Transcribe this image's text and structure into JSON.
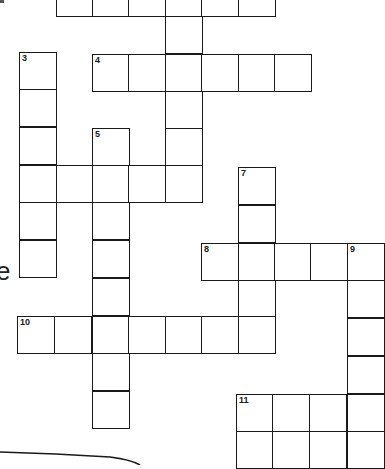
{
  "puzzle": {
    "type": "crossword",
    "cell_size_px": 36.5,
    "clue_numbers": [
      "3",
      "4",
      "5",
      "6",
      "7",
      "8",
      "9",
      "10",
      "11"
    ],
    "edge_text": "e",
    "cells": [
      {
        "x": 56,
        "y": -21,
        "num": ""
      },
      {
        "x": 92,
        "y": -21,
        "num": ""
      },
      {
        "x": 128,
        "y": -21,
        "num": ""
      },
      {
        "x": 165,
        "y": -21,
        "num": ""
      },
      {
        "x": 201,
        "y": -21,
        "num": ""
      },
      {
        "x": 238,
        "y": -21,
        "num": ""
      },
      {
        "x": 165,
        "y": 16,
        "num": ""
      },
      {
        "x": 19,
        "y": 52,
        "num": "3"
      },
      {
        "x": 19,
        "y": 89,
        "num": ""
      },
      {
        "x": 19,
        "y": 127,
        "num": ""
      },
      {
        "x": 19,
        "y": 165,
        "num": ""
      },
      {
        "x": 19,
        "y": 202,
        "num": ""
      },
      {
        "x": 19,
        "y": 240,
        "num": ""
      },
      {
        "x": 92,
        "y": 54,
        "num": "4"
      },
      {
        "x": 128,
        "y": 54,
        "num": ""
      },
      {
        "x": 165,
        "y": 54,
        "num": ""
      },
      {
        "x": 201,
        "y": 54,
        "num": ""
      },
      {
        "x": 238,
        "y": 54,
        "num": ""
      },
      {
        "x": 274,
        "y": 54,
        "num": ""
      },
      {
        "x": 165,
        "y": 91,
        "num": ""
      },
      {
        "x": 165,
        "y": 128,
        "num": ""
      },
      {
        "x": 92,
        "y": 128,
        "num": "5"
      },
      {
        "x": 56,
        "y": 165,
        "num": ""
      },
      {
        "x": 92,
        "y": 165,
        "num": ""
      },
      {
        "x": 128,
        "y": 165,
        "num": ""
      },
      {
        "x": 165,
        "y": 165,
        "num": ""
      },
      {
        "x": 92,
        "y": 202,
        "num": ""
      },
      {
        "x": 92,
        "y": 240,
        "num": ""
      },
      {
        "x": 92,
        "y": 278,
        "num": ""
      },
      {
        "x": 92,
        "y": 316,
        "num": ""
      },
      {
        "x": 92,
        "y": 353,
        "num": ""
      },
      {
        "x": 92,
        "y": 391,
        "num": ""
      },
      {
        "x": 238,
        "y": 167,
        "num": "7"
      },
      {
        "x": 238,
        "y": 205,
        "num": ""
      },
      {
        "x": 201,
        "y": 243,
        "num": "8"
      },
      {
        "x": 238,
        "y": 243,
        "num": ""
      },
      {
        "x": 274,
        "y": 243,
        "num": ""
      },
      {
        "x": 310,
        "y": 243,
        "num": ""
      },
      {
        "x": 347,
        "y": 243,
        "num": "9"
      },
      {
        "x": 238,
        "y": 280,
        "num": ""
      },
      {
        "x": 347,
        "y": 280,
        "num": ""
      },
      {
        "x": 347,
        "y": 318,
        "num": ""
      },
      {
        "x": 347,
        "y": 356,
        "num": ""
      },
      {
        "x": 17,
        "y": 316,
        "num": "10"
      },
      {
        "x": 54,
        "y": 316,
        "num": ""
      },
      {
        "x": 128,
        "y": 316,
        "num": ""
      },
      {
        "x": 165,
        "y": 316,
        "num": ""
      },
      {
        "x": 201,
        "y": 316,
        "num": ""
      },
      {
        "x": 238,
        "y": 316,
        "num": ""
      },
      {
        "x": 236,
        "y": 394,
        "num": "11"
      },
      {
        "x": 272,
        "y": 394,
        "num": ""
      },
      {
        "x": 309,
        "y": 394,
        "num": ""
      },
      {
        "x": 347,
        "y": 394,
        "num": ""
      },
      {
        "x": 236,
        "y": 431,
        "num": ""
      },
      {
        "x": 272,
        "y": 431,
        "num": ""
      },
      {
        "x": 309,
        "y": 431,
        "num": ""
      },
      {
        "x": 347,
        "y": 431,
        "num": ""
      }
    ]
  }
}
